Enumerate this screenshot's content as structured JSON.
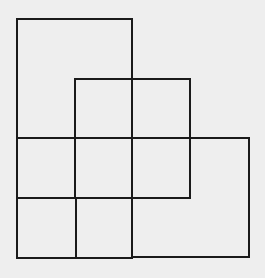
{
  "figure": {
    "background": "#eeeeee",
    "stroke": "#1a1a1a",
    "rects": [
      {
        "name": "tall-rect-top-left",
        "x": 17,
        "y": 19,
        "w": 115,
        "h": 119
      },
      {
        "name": "square-middle-top",
        "x": 75,
        "y": 79,
        "w": 115,
        "h": 119
      },
      {
        "name": "wide-rect-right",
        "x": 132,
        "y": 138,
        "w": 117,
        "h": 119
      },
      {
        "name": "row-band-middle",
        "x": 17,
        "y": 138,
        "w": 115,
        "h": 60
      },
      {
        "name": "square-bottom-left",
        "x": 17,
        "y": 198,
        "w": 115,
        "h": 60
      },
      {
        "name": "vertical-divider-left",
        "x": 75,
        "y": 198,
        "w": 0,
        "h": 60
      }
    ]
  }
}
